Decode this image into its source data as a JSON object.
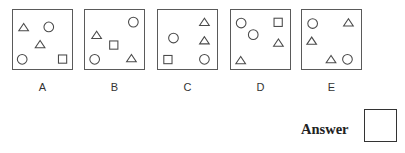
{
  "options": [
    {
      "label": "A",
      "shapes": [
        {
          "type": "triangle",
          "position": "top-left"
        },
        {
          "type": "circle",
          "position": "top-center"
        },
        {
          "type": "triangle",
          "position": "center"
        },
        {
          "type": "circle",
          "position": "bottom-left"
        },
        {
          "type": "square",
          "position": "bottom-right"
        }
      ]
    },
    {
      "label": "B",
      "shapes": [
        {
          "type": "circle",
          "position": "top-right"
        },
        {
          "type": "triangle",
          "position": "middle-left"
        },
        {
          "type": "square",
          "position": "center"
        },
        {
          "type": "circle",
          "position": "bottom-left"
        },
        {
          "type": "triangle",
          "position": "bottom-right"
        }
      ]
    },
    {
      "label": "C",
      "shapes": [
        {
          "type": "triangle",
          "position": "top-right"
        },
        {
          "type": "circle",
          "position": "middle-left"
        },
        {
          "type": "triangle",
          "position": "middle-right"
        },
        {
          "type": "square",
          "position": "bottom-left"
        },
        {
          "type": "circle",
          "position": "bottom-right"
        }
      ]
    },
    {
      "label": "D",
      "shapes": [
        {
          "type": "circle",
          "position": "top-left"
        },
        {
          "type": "square",
          "position": "top-right"
        },
        {
          "type": "circle",
          "position": "center"
        },
        {
          "type": "triangle",
          "position": "middle-right"
        },
        {
          "type": "triangle",
          "position": "bottom-left"
        }
      ]
    },
    {
      "label": "E",
      "shapes": [
        {
          "type": "circle",
          "position": "top-left"
        },
        {
          "type": "triangle",
          "position": "top-right"
        },
        {
          "type": "triangle",
          "position": "middle-left"
        },
        {
          "type": "triangle",
          "position": "bottom-center"
        },
        {
          "type": "circle",
          "position": "bottom-right"
        }
      ]
    }
  ],
  "answer": {
    "label": "Answer",
    "value": ""
  },
  "colors": {
    "stroke": "#4a4a4a",
    "border": "#5a5a5a",
    "background": "#ffffff"
  }
}
